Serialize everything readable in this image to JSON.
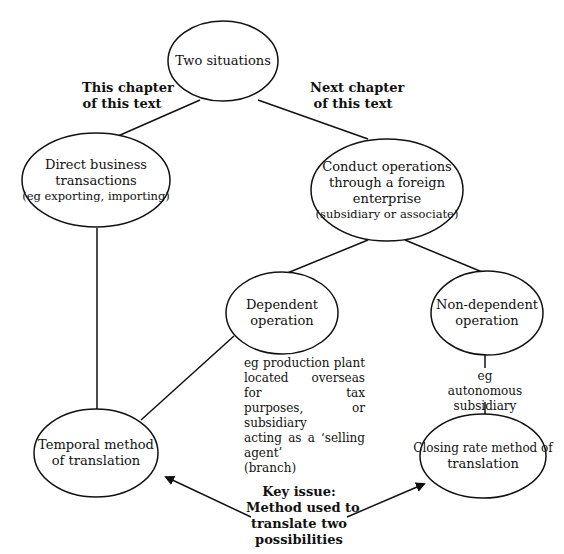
{
  "diagram": {
    "type": "tree",
    "nodes": {
      "root": {
        "lines": [
          "Two situations"
        ]
      },
      "direct": {
        "lines": [
          "Direct business",
          "transactions"
        ],
        "sub": "(eg exporting, importing)"
      },
      "conduct": {
        "lines": [
          "Conduct operations",
          "through a foreign",
          "enterprise"
        ],
        "sub": "(subsidiary or associate)"
      },
      "dependent": {
        "lines": [
          "Dependent",
          "operation"
        ]
      },
      "nondependent": {
        "lines": [
          "Non-dependent",
          "operation"
        ]
      },
      "temporal": {
        "lines": [
          "Temporal method",
          "of translation"
        ]
      },
      "closing": {
        "lines": [
          "Closing rate method of",
          "translation"
        ]
      }
    },
    "edge_labels": {
      "this_chapter": [
        "This chapter",
        "of this text"
      ],
      "next_chapter": [
        "Next chapter",
        "of this text"
      ]
    },
    "notes": {
      "dependent_example": [
        "eg production plant",
        "located overseas for tax",
        "purposes, or subsidiary",
        "acting as a ‘selling agent’",
        "(branch)"
      ],
      "nondependent_example": [
        "eg autonomous",
        "subsidiary"
      ]
    },
    "key_issue": [
      "Key issue:",
      "Method used to",
      "translate two",
      "possibilities"
    ],
    "edges": [
      {
        "from": "root",
        "to": "direct",
        "label": "this_chapter"
      },
      {
        "from": "root",
        "to": "conduct",
        "label": "next_chapter"
      },
      {
        "from": "conduct",
        "to": "dependent"
      },
      {
        "from": "conduct",
        "to": "nondependent"
      },
      {
        "from": "direct",
        "to": "temporal"
      },
      {
        "from": "dependent",
        "to": "temporal"
      },
      {
        "from": "nondependent",
        "to": "closing"
      },
      {
        "from": "key_issue",
        "to": "temporal",
        "arrow": true
      },
      {
        "from": "key_issue",
        "to": "closing",
        "arrow": true
      }
    ],
    "colors": {
      "stroke": "#111111",
      "background": "#ffffff"
    }
  }
}
